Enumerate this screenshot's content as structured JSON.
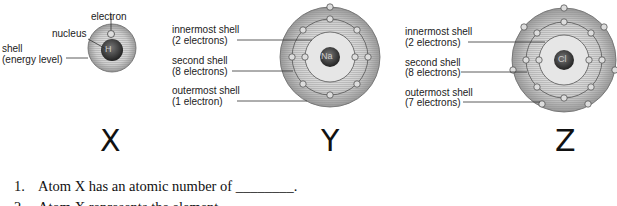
{
  "atoms": {
    "x": {
      "letter": "X",
      "symbol": "H",
      "labels": {
        "electron": "electron",
        "nucleus": "nucleus",
        "shell_line1": "shell",
        "shell_line2": "(energy level)"
      }
    },
    "y": {
      "letter": "Y",
      "symbol": "Na",
      "labels": {
        "inner1": "innermost shell",
        "inner2": "(2 electrons)",
        "second1": "second shell",
        "second2": "(8 electrons)",
        "outer1": "outermost shell",
        "outer2": "(1 electron)"
      }
    },
    "z": {
      "letter": "Z",
      "symbol": "Cl",
      "labels": {
        "inner1": "innermost shell",
        "inner2": "(2 electrons)",
        "second1": "second shell",
        "second2": "(8 electrons)",
        "outer1": "outermost shell",
        "outer2": "(7 electrons)"
      }
    }
  },
  "questions": [
    {
      "num": "1.",
      "text": "Atom X has an atomic number of ________."
    },
    {
      "num": "2.",
      "text": "Atom X represents the element"
    }
  ]
}
